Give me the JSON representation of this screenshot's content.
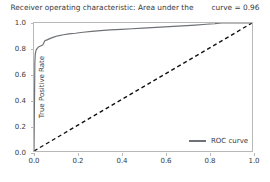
{
  "chart_data": {
    "type": "line",
    "title": "Receiver operating characteristic: Area under the",
    "title_tail": "curve = 0.96",
    "xlabel": "False Positive Rate",
    "ylabel": "True Positive Rate",
    "xlim": [
      0.0,
      1.0
    ],
    "ylim": [
      0.0,
      1.0
    ],
    "xticks": [
      "0.0",
      "0.2",
      "0.4",
      "0.6",
      "0.8",
      "1.0"
    ],
    "xtick_values": [
      0.0,
      0.2,
      0.4,
      0.6,
      0.8,
      1.0
    ],
    "yticks": [
      "0.0",
      "0.2",
      "0.4",
      "0.6",
      "0.8",
      "1.0"
    ],
    "ytick_values": [
      0.0,
      0.2,
      0.4,
      0.6,
      0.8,
      1.0
    ],
    "grid": false,
    "legend_position": "lower right",
    "auc": 0.96,
    "series": [
      {
        "name": "ROC curve",
        "color": "#6e7175",
        "style": "solid",
        "x": [
          0.0,
          0.004,
          0.006,
          0.01,
          0.014,
          0.02,
          0.03,
          0.04,
          0.05,
          0.06,
          0.075,
          0.09,
          0.11,
          0.135,
          0.16,
          0.19,
          0.225,
          0.265,
          0.305,
          0.35,
          0.4,
          0.45,
          0.5,
          0.56,
          0.62,
          0.68,
          0.74,
          0.79,
          0.83,
          0.86,
          0.9,
          1.0
        ],
        "y": [
          0.0,
          0.7,
          0.76,
          0.79,
          0.8,
          0.812,
          0.82,
          0.828,
          0.862,
          0.868,
          0.88,
          0.89,
          0.9,
          0.908,
          0.915,
          0.92,
          0.928,
          0.934,
          0.94,
          0.946,
          0.95,
          0.955,
          0.96,
          0.966,
          0.972,
          0.978,
          0.984,
          0.99,
          0.995,
          1.0,
          1.0,
          1.0
        ]
      },
      {
        "name": "chance-diagonal",
        "color": "#111111",
        "style": "dashed",
        "x": [
          0.0,
          1.0
        ],
        "y": [
          0.0,
          1.0
        ]
      }
    ],
    "legend": [
      {
        "label": "ROC curve",
        "color": "#6e7175",
        "style": "solid"
      }
    ]
  }
}
